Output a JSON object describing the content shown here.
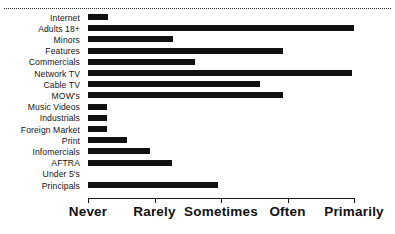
{
  "chart_data": {
    "type": "bar",
    "orientation": "horizontal",
    "title": "",
    "xlabel": "",
    "ylabel": "",
    "grid": false,
    "legend": null,
    "x_tick_labels": [
      "Never",
      "Rarely",
      "Sometimes",
      "Often",
      "Primarily"
    ],
    "x_tick_values": [
      0,
      1,
      2,
      3,
      4
    ],
    "xlim": [
      0,
      4
    ],
    "categories": [
      "Internet",
      "Adults 18+",
      "Minors",
      "Features",
      "Commercials",
      "Network TV",
      "Cable TV",
      "MOW's",
      "Music Videos",
      "Industrials",
      "Foreign Market",
      "Print",
      "Infomercials",
      "AFTRA",
      "Under 5's",
      "Principals"
    ],
    "values": [
      0.3,
      4.0,
      1.28,
      2.93,
      1.61,
      3.97,
      2.59,
      2.93,
      0.29,
      0.29,
      0.29,
      0.59,
      0.93,
      1.26,
      0.0,
      1.95
    ],
    "bar_color": "#111111",
    "axis_color": "#1b1b1b"
  },
  "decorations": {
    "top_rule": "dotted-horizontal-rule"
  }
}
